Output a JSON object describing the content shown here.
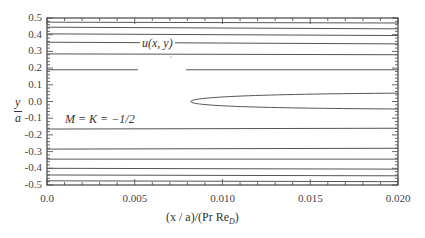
{
  "chart_data": {
    "type": "line",
    "title": "",
    "subtitle": "Streamline contours",
    "xlabel": "(x / a)/(Pr Re_D)",
    "ylabel": "y / a",
    "xlim": [
      0.0,
      0.02
    ],
    "ylim": [
      -0.5,
      0.5
    ],
    "grid": false,
    "x_ticks": [
      "0.0",
      "0.005",
      "0.010",
      "0.015",
      "0.020"
    ],
    "y_ticks": [
      "0.5",
      "0.4",
      "0.3",
      "0.2",
      "0.1",
      "0.0",
      "-0.1",
      "-0.2",
      "-0.3",
      "-0.4",
      "-0.5"
    ],
    "annotations": [
      {
        "text": "u(x, y)",
        "x": 0.0075,
        "y": 0.19
      },
      {
        "text": "M = K = −1/2",
        "x": 0.0015,
        "y": -0.115
      }
    ],
    "series": [
      {
        "name": "contour-top-1",
        "x": [
          0.0,
          0.02
        ],
        "y": [
          0.475,
          0.47
        ]
      },
      {
        "name": "contour-top-2",
        "x": [
          0.0,
          0.02
        ],
        "y": [
          0.445,
          0.435
        ]
      },
      {
        "name": "contour-top-3",
        "x": [
          0.0,
          0.02
        ],
        "y": [
          0.405,
          0.395
        ]
      },
      {
        "name": "contour-top-4",
        "x": [
          0.0,
          0.02
        ],
        "y": [
          0.355,
          0.345
        ]
      },
      {
        "name": "contour-top-5",
        "x": [
          0.0,
          0.02
        ],
        "y": [
          0.285,
          0.28
        ]
      },
      {
        "name": "contour-u",
        "x": [
          0.0,
          0.02
        ],
        "y": [
          0.19,
          0.19
        ]
      },
      {
        "name": "contour-closed",
        "x": [
          0.0082,
          0.012,
          0.016,
          0.02,
          0.016,
          0.012,
          0.0082
        ],
        "y": [
          0.0,
          0.032,
          0.045,
          0.05,
          -0.045,
          -0.037,
          0.0
        ]
      },
      {
        "name": "contour-bot-1",
        "x": [
          0.0,
          0.02
        ],
        "y": [
          -0.165,
          -0.16
        ]
      },
      {
        "name": "contour-bot-2",
        "x": [
          0.0,
          0.02
        ],
        "y": [
          -0.285,
          -0.28
        ]
      },
      {
        "name": "contour-bot-3",
        "x": [
          0.0,
          0.02
        ],
        "y": [
          -0.345,
          -0.345
        ]
      },
      {
        "name": "contour-bot-4",
        "x": [
          0.0,
          0.02
        ],
        "y": [
          -0.4,
          -0.405
        ]
      },
      {
        "name": "contour-bot-5",
        "x": [
          0.0,
          0.02
        ],
        "y": [
          -0.44,
          -0.445
        ]
      },
      {
        "name": "contour-bot-6",
        "x": [
          0.0,
          0.02
        ],
        "y": [
          -0.475,
          -0.48
        ]
      }
    ]
  },
  "labels": {
    "x_axis_title": "(x / a)/(Pr Re",
    "x_axis_sub": "D",
    "x_axis_close": ")",
    "y_axis_num": "y",
    "y_axis_den": "a",
    "annot_u": "u(x, y)",
    "annot_mk": "M = K = −1/2"
  },
  "colors": {
    "line": "#555555",
    "axis": "#444444"
  }
}
